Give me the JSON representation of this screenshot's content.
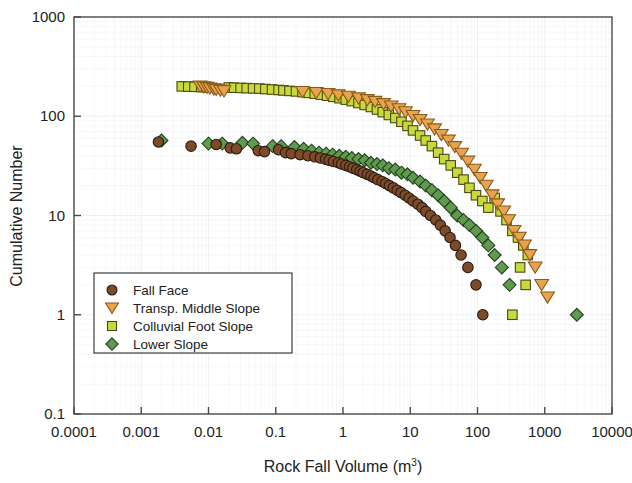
{
  "chart_data": {
    "type": "scatter",
    "title": "",
    "xlabel": "Rock Fall Volume (m3)",
    "xlabel_main": "Rock Fall Volume (m",
    "xlabel_sup": "3",
    "xlabel_tail": ")",
    "ylabel": "Cumulative Number",
    "xscale": "log",
    "yscale": "log",
    "xlim": [
      0.0001,
      10000
    ],
    "ylim": [
      0.1,
      1000
    ],
    "grid": true,
    "grid_style": "faint minor log grid (scan artifact)",
    "legend_position": "lower-left inside axes",
    "xticks": [
      "0.0001",
      "0.001",
      "0.01",
      "0.1",
      "1",
      "10",
      "100",
      "1000",
      "10000"
    ],
    "xtick_values": [
      0.0001,
      0.001,
      0.01,
      0.1,
      1,
      10,
      100,
      1000,
      10000
    ],
    "yticks": [
      "1000",
      "100",
      "10",
      "1",
      "0.1"
    ],
    "ytick_values": [
      1000,
      100,
      10,
      1,
      0.1
    ],
    "series": [
      {
        "name": "Fall Face",
        "marker": "circle",
        "color": "#7c4b2a",
        "edge": "#2c1a0d",
        "points": [
          [
            0.0018,
            55
          ],
          [
            0.0055,
            50
          ],
          [
            0.013,
            52
          ],
          [
            0.021,
            48
          ],
          [
            0.026,
            47
          ],
          [
            0.055,
            45
          ],
          [
            0.068,
            44
          ],
          [
            0.11,
            46
          ],
          [
            0.14,
            43
          ],
          [
            0.17,
            42
          ],
          [
            0.23,
            41
          ],
          [
            0.3,
            40
          ],
          [
            0.38,
            39
          ],
          [
            0.46,
            38
          ],
          [
            0.55,
            37
          ],
          [
            0.62,
            36
          ],
          [
            0.72,
            35
          ],
          [
            0.85,
            34
          ],
          [
            0.95,
            33
          ],
          [
            1.1,
            32
          ],
          [
            1.25,
            31
          ],
          [
            1.4,
            30
          ],
          [
            1.6,
            29
          ],
          [
            1.8,
            28
          ],
          [
            2.0,
            27
          ],
          [
            2.3,
            26
          ],
          [
            2.6,
            25
          ],
          [
            2.9,
            24
          ],
          [
            3.3,
            23
          ],
          [
            3.8,
            22
          ],
          [
            4.3,
            21
          ],
          [
            4.9,
            20
          ],
          [
            5.6,
            19
          ],
          [
            6.4,
            18
          ],
          [
            7.3,
            17
          ],
          [
            8.4,
            16
          ],
          [
            9.6,
            15
          ],
          [
            11,
            14
          ],
          [
            13,
            13
          ],
          [
            15,
            12
          ],
          [
            17,
            11
          ],
          [
            20,
            10
          ],
          [
            24,
            9
          ],
          [
            28,
            8
          ],
          [
            33,
            7
          ],
          [
            39,
            6
          ],
          [
            47,
            5
          ],
          [
            57,
            4
          ],
          [
            72,
            3
          ],
          [
            95,
            2
          ],
          [
            120,
            1
          ]
        ]
      },
      {
        "name": "Transp. Middle Slope",
        "marker": "triangle-down",
        "color": "#e8a44c",
        "edge": "#8a5a18",
        "points": [
          [
            0.0075,
            200
          ],
          [
            0.0085,
            197
          ],
          [
            0.0095,
            194
          ],
          [
            0.0105,
            191
          ],
          [
            0.012,
            188
          ],
          [
            0.013,
            185
          ],
          [
            0.015,
            182
          ],
          [
            0.017,
            179
          ],
          [
            0.25,
            176
          ],
          [
            0.4,
            172
          ],
          [
            0.6,
            168
          ],
          [
            0.85,
            163
          ],
          [
            1.2,
            158
          ],
          [
            1.7,
            152
          ],
          [
            2.3,
            146
          ],
          [
            3.0,
            140
          ],
          [
            4.0,
            133
          ],
          [
            5.2,
            126
          ],
          [
            6.8,
            118
          ],
          [
            8.5,
            110
          ],
          [
            11,
            101
          ],
          [
            14,
            92
          ],
          [
            18,
            83
          ],
          [
            23,
            74
          ],
          [
            29,
            65
          ],
          [
            37,
            57
          ],
          [
            46,
            49
          ],
          [
            58,
            42
          ],
          [
            72,
            35
          ],
          [
            90,
            29
          ],
          [
            110,
            24
          ],
          [
            135,
            20
          ],
          [
            165,
            16
          ],
          [
            200,
            13
          ],
          [
            245,
            11
          ],
          [
            290,
            9
          ],
          [
            350,
            7
          ],
          [
            420,
            6
          ],
          [
            500,
            5
          ],
          [
            600,
            4
          ],
          [
            720,
            3
          ],
          [
            900,
            2
          ],
          [
            1100,
            1.5
          ]
        ]
      },
      {
        "name": "Colluvial Foot Slope",
        "marker": "square",
        "color": "#c8d93c",
        "edge": "#4a4a10",
        "points": [
          [
            0.004,
            200
          ],
          [
            0.005,
            199
          ],
          [
            0.0062,
            198
          ],
          [
            0.0078,
            197
          ],
          [
            0.0095,
            196
          ],
          [
            0.02,
            195
          ],
          [
            0.024,
            194
          ],
          [
            0.03,
            193
          ],
          [
            0.037,
            192
          ],
          [
            0.046,
            191
          ],
          [
            0.057,
            190
          ],
          [
            0.07,
            188
          ],
          [
            0.088,
            186
          ],
          [
            0.11,
            184
          ],
          [
            0.13,
            182
          ],
          [
            0.16,
            180
          ],
          [
            0.2,
            178
          ],
          [
            0.25,
            175
          ],
          [
            0.31,
            172
          ],
          [
            0.38,
            169
          ],
          [
            0.47,
            165
          ],
          [
            0.58,
            161
          ],
          [
            0.72,
            157
          ],
          [
            0.89,
            152
          ],
          [
            1.1,
            147
          ],
          [
            1.35,
            142
          ],
          [
            1.7,
            136
          ],
          [
            2.1,
            130
          ],
          [
            2.6,
            124
          ],
          [
            3.2,
            117
          ],
          [
            3.9,
            110
          ],
          [
            4.8,
            103
          ],
          [
            6.0,
            96
          ],
          [
            7.4,
            88
          ],
          [
            9.1,
            80
          ],
          [
            11,
            72
          ],
          [
            14,
            64
          ],
          [
            17,
            57
          ],
          [
            21,
            50
          ],
          [
            26,
            43
          ],
          [
            32,
            37
          ],
          [
            40,
            32
          ],
          [
            50,
            27
          ],
          [
            62,
            23
          ],
          [
            76,
            19
          ],
          [
            95,
            16
          ],
          [
            118,
            14
          ],
          [
            145,
            12
          ],
          [
            180,
            15
          ],
          [
            220,
            11
          ],
          [
            270,
            9
          ],
          [
            330,
            7
          ],
          [
            400,
            6
          ],
          [
            480,
            5
          ],
          [
            560,
            4
          ],
          [
            430,
            3
          ],
          [
            520,
            2
          ],
          [
            330,
            1
          ]
        ]
      },
      {
        "name": "Lower Slope",
        "marker": "diamond",
        "color": "#5f9a4f",
        "edge": "#24401c",
        "points": [
          [
            0.002,
            57
          ],
          [
            0.01,
            53
          ],
          [
            0.016,
            53
          ],
          [
            0.032,
            54
          ],
          [
            0.046,
            53
          ],
          [
            0.09,
            50
          ],
          [
            0.12,
            50
          ],
          [
            0.19,
            49
          ],
          [
            0.26,
            47
          ],
          [
            0.34,
            45
          ],
          [
            0.44,
            43
          ],
          [
            0.56,
            42
          ],
          [
            0.7,
            41
          ],
          [
            0.88,
            40
          ],
          [
            1.1,
            39
          ],
          [
            1.35,
            38
          ],
          [
            1.7,
            37
          ],
          [
            2.1,
            36
          ],
          [
            2.6,
            34
          ],
          [
            3.2,
            33
          ],
          [
            3.9,
            32
          ],
          [
            4.8,
            30
          ],
          [
            6.0,
            29
          ],
          [
            7.4,
            27
          ],
          [
            9.1,
            26
          ],
          [
            11,
            24
          ],
          [
            14,
            22
          ],
          [
            17,
            20
          ],
          [
            21,
            18
          ],
          [
            26,
            16
          ],
          [
            32,
            14
          ],
          [
            40,
            12
          ],
          [
            50,
            10
          ],
          [
            62,
            9
          ],
          [
            76,
            8
          ],
          [
            95,
            7
          ],
          [
            118,
            6
          ],
          [
            145,
            5
          ],
          [
            180,
            4
          ],
          [
            230,
            3
          ],
          [
            300,
            2
          ],
          [
            3000,
            1
          ]
        ]
      }
    ]
  },
  "legend": {
    "items": [
      {
        "label": "Fall Face",
        "marker": "circle",
        "color": "#7c4b2a"
      },
      {
        "label": "Transp. Middle Slope",
        "marker": "triangle-down",
        "color": "#e8a44c"
      },
      {
        "label": "Colluvial Foot Slope",
        "marker": "square",
        "color": "#c8d93c"
      },
      {
        "label": "Lower Slope",
        "marker": "diamond",
        "color": "#5f9a4f"
      }
    ]
  },
  "colors": {
    "axis": "#4a4a4a",
    "text": "#1f1f1f",
    "background": "#ffffff",
    "grid": "#eceef2"
  }
}
